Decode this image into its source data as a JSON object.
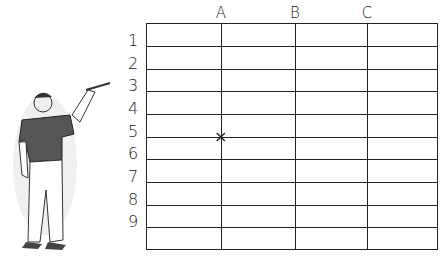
{
  "grid": {
    "columns": [
      "A",
      "B",
      "C"
    ],
    "rows": [
      "1",
      "2",
      "3",
      "4",
      "5",
      "6",
      "7",
      "8",
      "9"
    ],
    "marker": {
      "symbol": "×",
      "column": "A",
      "row": "5"
    }
  },
  "figure": {
    "icon": "man-pointing-illustration"
  }
}
